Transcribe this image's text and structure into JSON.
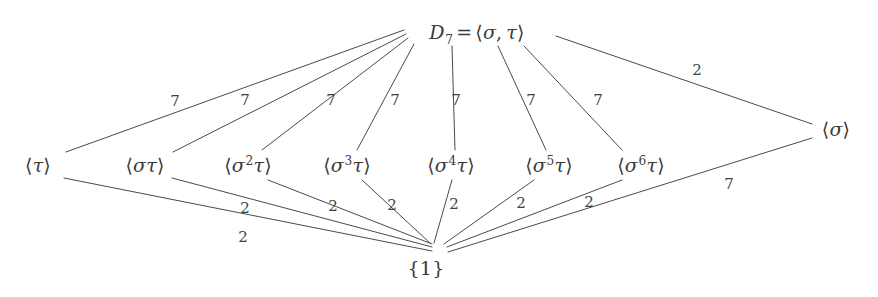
{
  "figure": {
    "background_color": "#ffffff",
    "line_color": "#4a4a4a",
    "text_color": "#3a3a3a"
  },
  "nodes": [
    {
      "id": "top",
      "text": "D7 = <sigma, tau>",
      "x": 477,
      "y": 32,
      "kind": "group-top"
    },
    {
      "id": "tau",
      "text": "<tau>",
      "x": 38,
      "y": 165,
      "kind": "reflection"
    },
    {
      "id": "st",
      "text": "<sigma tau>",
      "x": 145,
      "y": 165,
      "kind": "reflection"
    },
    {
      "id": "s2t",
      "text": "<sigma^2 tau>",
      "x": 248,
      "y": 165,
      "kind": "reflection"
    },
    {
      "id": "s3t",
      "text": "<sigma^3 tau>",
      "x": 347,
      "y": 165,
      "kind": "reflection"
    },
    {
      "id": "s4t",
      "text": "<sigma^4 tau>",
      "x": 451,
      "y": 165,
      "kind": "reflection"
    },
    {
      "id": "s5t",
      "text": "<sigma^5 tau>",
      "x": 549,
      "y": 165,
      "kind": "reflection"
    },
    {
      "id": "s6t",
      "text": "<sigma^6 tau>",
      "x": 641,
      "y": 165,
      "kind": "reflection"
    },
    {
      "id": "sigma",
      "text": "<sigma>",
      "x": 836,
      "y": 129,
      "kind": "rotation"
    },
    {
      "id": "trivial",
      "text": "{1}",
      "x": 426,
      "y": 268,
      "kind": "trivial"
    }
  ],
  "edges": [
    {
      "from": "top",
      "to": "tau",
      "label": "7",
      "label_x": 175,
      "label_y": 101
    },
    {
      "from": "top",
      "to": "st",
      "label": "7",
      "label_x": 245,
      "label_y": 100
    },
    {
      "from": "top",
      "to": "s2t",
      "label": "7",
      "label_x": 331,
      "label_y": 100
    },
    {
      "from": "top",
      "to": "s3t",
      "label": "7",
      "label_x": 395,
      "label_y": 100
    },
    {
      "from": "top",
      "to": "s4t",
      "label": "7",
      "label_x": 456,
      "label_y": 100
    },
    {
      "from": "top",
      "to": "s5t",
      "label": "7",
      "label_x": 531,
      "label_y": 100
    },
    {
      "from": "top",
      "to": "s6t",
      "label": "7",
      "label_x": 598,
      "label_y": 100
    },
    {
      "from": "top",
      "to": "sigma",
      "label": "2",
      "label_x": 697,
      "label_y": 70
    },
    {
      "from": "tau",
      "to": "trivial",
      "label": "2",
      "label_x": 243,
      "label_y": 237
    },
    {
      "from": "st",
      "to": "trivial",
      "label": "2",
      "label_x": 245,
      "label_y": 208
    },
    {
      "from": "s2t",
      "to": "trivial",
      "label": "2",
      "label_x": 333,
      "label_y": 206
    },
    {
      "from": "s3t",
      "to": "trivial",
      "label": "2",
      "label_x": 392,
      "label_y": 205
    },
    {
      "from": "s4t",
      "to": "trivial",
      "label": "2",
      "label_x": 454,
      "label_y": 204
    },
    {
      "from": "s5t",
      "to": "trivial",
      "label": "2",
      "label_x": 521,
      "label_y": 203
    },
    {
      "from": "s6t",
      "to": "trivial",
      "label": "2",
      "label_x": 589,
      "label_y": 202
    },
    {
      "from": "sigma",
      "to": "trivial",
      "label": "7",
      "label_x": 729,
      "label_y": 184
    }
  ],
  "edge_labels_top": [
    "7",
    "7",
    "7",
    "7",
    "7",
    "7",
    "7",
    "2"
  ],
  "edge_labels_bottom": [
    "2",
    "2",
    "2",
    "2",
    "2",
    "2",
    "2",
    "7"
  ]
}
